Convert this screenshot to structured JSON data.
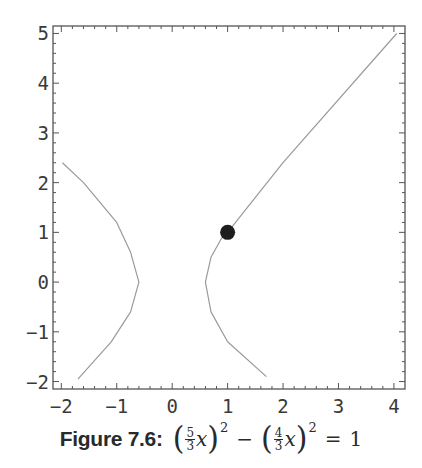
{
  "chart_data": {
    "type": "line",
    "title": "",
    "xlabel": "",
    "ylabel": "",
    "xlim": [
      -2.15,
      4.2
    ],
    "ylim": [
      -2.15,
      5.15
    ],
    "grid": false,
    "legend": null,
    "x_ticks": [
      "-2",
      "-1",
      "0",
      "1",
      "2",
      "3",
      "4"
    ],
    "y_ticks": [
      "5",
      "4",
      "3",
      "2",
      "1",
      "0",
      "-1",
      "-2"
    ],
    "series": [
      {
        "name": "left-branch",
        "color": "#9a9a9a",
        "points": [
          [
            -1.98,
            2.4
          ],
          [
            -1.6,
            2.0
          ],
          [
            -1.0,
            1.2
          ],
          [
            -0.75,
            0.6
          ],
          [
            -0.6,
            0.0
          ],
          [
            -0.75,
            -0.6
          ],
          [
            -1.1,
            -1.2
          ],
          [
            -1.7,
            -1.95
          ]
        ]
      },
      {
        "name": "right-branch",
        "color": "#9a9a9a",
        "points": [
          [
            1.7,
            -1.9
          ],
          [
            1.0,
            -1.2
          ],
          [
            0.7,
            -0.6
          ],
          [
            0.6,
            0.0
          ],
          [
            0.7,
            0.5
          ],
          [
            0.9,
            0.9
          ],
          [
            1.0,
            1.0
          ],
          [
            2.0,
            2.4
          ],
          [
            4.05,
            5.0
          ]
        ]
      }
    ],
    "markers": [
      {
        "name": "highlighted-point",
        "x": 1,
        "y": 1,
        "color": "#1e1e1e"
      }
    ]
  },
  "caption": {
    "label": "Figure 7.6:",
    "term1_num": "5",
    "term1_den": "3",
    "term2_num": "4",
    "term2_den": "3",
    "var": "x",
    "exponent": "2",
    "minus": "−",
    "equals": "=",
    "rhs": "1",
    "lparen": "(",
    "rparen": ")"
  }
}
